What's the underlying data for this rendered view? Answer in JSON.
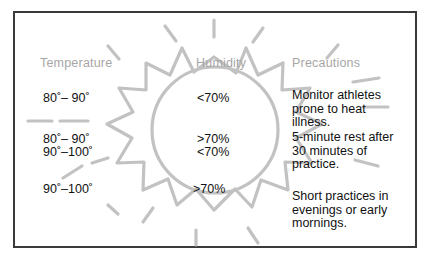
{
  "figure": {
    "border_color": "#3a3a3a",
    "background": "#ffffff",
    "sun_color": "#c2c2c2",
    "header_color": "#a6a6a6",
    "text_color": "#111111",
    "caption": ""
  },
  "columns": {
    "temperature_header": "Temperature",
    "humidity_header": "Humidity",
    "precautions_header": "Precautions"
  },
  "rows": [
    {
      "temperature": "80˚– 90˚",
      "humidity": "<70%",
      "precaution": "Monitor athletes\nprone to heat\nillness."
    },
    {
      "temperature": "80˚– 90˚",
      "humidity": ">70%",
      "precaution": "5-minute rest after\n30 minutes of\npractice."
    },
    {
      "temperature": "90˚–100˚",
      "humidity": "<70%",
      "precaution": ""
    },
    {
      "temperature": "90˚–100˚",
      "humidity": ">70%",
      "precaution": "Short practices in\nevenings or early\nmornings."
    }
  ],
  "graphic": {
    "name": "sun-illustration",
    "description": "stylized sun with circular disc, spiked rays and detached dash rays"
  }
}
